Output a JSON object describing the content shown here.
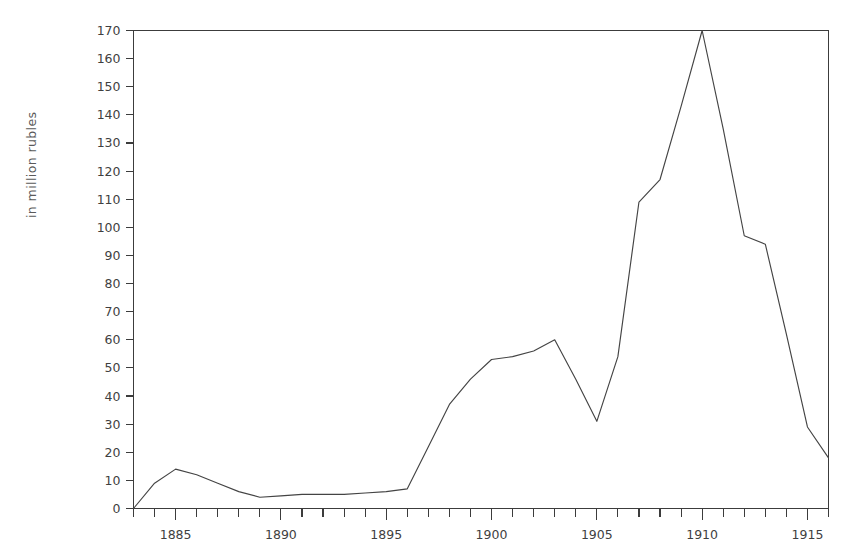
{
  "chart_data": {
    "type": "line",
    "title": "",
    "xlabel": "",
    "ylabel": "in million rubles",
    "xlim": [
      1883,
      1916
    ],
    "ylim": [
      0,
      170
    ],
    "ytick_step": 10,
    "grid": false,
    "legend": null,
    "y_ticks": [
      0,
      10,
      20,
      30,
      40,
      50,
      60,
      70,
      80,
      90,
      100,
      110,
      120,
      130,
      140,
      150,
      160,
      170
    ],
    "y_tick_labels": [
      "0",
      "10",
      "20",
      "30",
      "40",
      "50",
      "60",
      "70",
      "80",
      "90",
      "100",
      "110",
      "120",
      "130",
      "140",
      "150",
      "160",
      "170"
    ],
    "x_ticks_major": [
      1885,
      1890,
      1895,
      1900,
      1905,
      1910,
      1915
    ],
    "x_tick_labels": [
      "1885",
      "1890",
      "1895",
      "1900",
      "1905",
      "1910",
      "1915"
    ],
    "x_minor_tick_interval": 1,
    "x": [
      1883,
      1884,
      1885,
      1886,
      1887,
      1888,
      1889,
      1890,
      1891,
      1892,
      1893,
      1894,
      1895,
      1896,
      1897,
      1898,
      1899,
      1900,
      1901,
      1902,
      1903,
      1904,
      1905,
      1906,
      1907,
      1908,
      1909,
      1910,
      1911,
      1912,
      1913,
      1914,
      1915,
      1916
    ],
    "values": [
      0,
      9,
      14,
      12,
      9,
      6,
      4,
      4.5,
      5,
      5,
      5,
      5.5,
      6,
      7,
      22,
      37,
      46,
      53,
      54,
      56,
      60,
      46,
      31,
      54,
      109,
      117,
      143,
      170,
      135,
      97,
      94,
      62,
      29,
      18
    ],
    "series": [
      {
        "name": "value",
        "values": [
          0,
          9,
          14,
          12,
          9,
          6,
          4,
          4.5,
          5,
          5,
          5,
          5.5,
          6,
          7,
          22,
          37,
          46,
          53,
          54,
          56,
          60,
          46,
          31,
          54,
          109,
          117,
          143,
          170,
          135,
          97,
          94,
          62,
          29,
          18
        ]
      }
    ],
    "line_color": "#444444",
    "background_color": "#ffffff",
    "axis_color": "#3c3c3c"
  }
}
